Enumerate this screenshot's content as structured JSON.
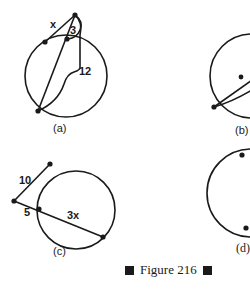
{
  "figure": {
    "caption": "Figure 216",
    "ink_color": "#1a1a1a",
    "background": "#ffffff"
  },
  "panels": [
    {
      "id": "a",
      "label": "(a)",
      "segment_labels": {
        "external": "x",
        "inner_external": "3",
        "whole_secant": "12"
      }
    },
    {
      "id": "b",
      "label": "(b)"
    },
    {
      "id": "c",
      "label": "(c)",
      "segment_labels": {
        "tangent_like": "10",
        "external": "5",
        "internal": "3x"
      }
    },
    {
      "id": "d",
      "label": "(d)"
    }
  ]
}
